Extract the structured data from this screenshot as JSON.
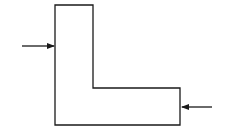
{
  "diagram": {
    "shape": "L-shaped outline",
    "stroke_color": "#1a1a1a",
    "background": "#ffffff",
    "outline_points": "55,5 93,5 93,88 180,88 180,125 55,125",
    "arrows": [
      {
        "name": "left-arrow",
        "direction": "right",
        "x1": 22,
        "y1": 46,
        "x2": 54,
        "y2": 46
      },
      {
        "name": "right-arrow",
        "direction": "left",
        "x1": 212,
        "y1": 107,
        "x2": 182,
        "y2": 107
      }
    ]
  }
}
